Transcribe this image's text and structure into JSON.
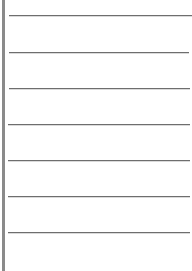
{
  "page": {
    "type": "blank-lined-paper",
    "colors": {
      "background": "#ffffff",
      "margin_bar": "#8a8a8a",
      "rule_line": "#6e6e6e"
    },
    "rules": [
      {
        "y": 15,
        "x1": 9,
        "x2": 192
      },
      {
        "y": 52,
        "x1": 9,
        "x2": 189
      },
      {
        "y": 88,
        "x1": 9,
        "x2": 190
      },
      {
        "y": 124,
        "x1": 8,
        "x2": 190
      },
      {
        "y": 160,
        "x1": 8,
        "x2": 190
      },
      {
        "y": 196,
        "x1": 8,
        "x2": 190
      },
      {
        "y": 232,
        "x1": 8,
        "x2": 190
      }
    ]
  }
}
